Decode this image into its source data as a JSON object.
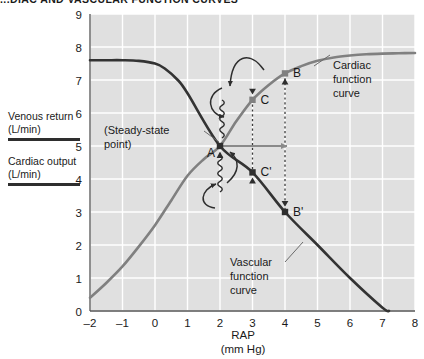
{
  "figure": {
    "title": "...DIAC AND VASCULAR FUNCTION CURVES",
    "background": "#ffffff",
    "plot_background": "#e0e0e0",
    "grid_color": "#ffffff"
  },
  "legend": {
    "entries": [
      {
        "label_line1": "Venous return",
        "label_line2": "(L/min)",
        "color": "#2e2e2e"
      },
      {
        "label_line1": "Cardiac output",
        "label_line2": "(L/min)",
        "color": "#2e2e2e"
      }
    ]
  },
  "annotations": {
    "cardiac_curve_label": {
      "line1": "Cardiac",
      "line2": "function",
      "line3": "curve"
    },
    "vascular_curve_label": {
      "line1": "Vascular",
      "line2": "function",
      "line3": "curve"
    },
    "steady_state_label": {
      "line1": "(Steady-state",
      "line2": "point)"
    },
    "points": [
      {
        "name": "A",
        "label": "A",
        "rap": 2,
        "flow": 5.0,
        "color": "#2e2e2e"
      },
      {
        "name": "B",
        "label": "B",
        "rap": 4,
        "flow": 7.2,
        "color": "#808080"
      },
      {
        "name": "C",
        "label": "C",
        "rap": 3,
        "flow": 6.4,
        "color": "#808080"
      },
      {
        "name": "Bp",
        "label": "B'",
        "rap": 4,
        "flow": 3.0,
        "color": "#2e2e2e"
      },
      {
        "name": "Cp",
        "label": "C'",
        "rap": 3,
        "flow": 4.2,
        "color": "#2e2e2e"
      }
    ]
  },
  "chart_data": {
    "type": "line",
    "xlabel": "RAP",
    "xlabel_units": "(mm Hg)",
    "ylabel": "Venous return / Cardiac output (L/min)",
    "xlim": [
      -2,
      8
    ],
    "ylim": [
      0,
      9
    ],
    "xticks": [
      "–2",
      "–1",
      "0",
      "1",
      "2",
      "3",
      "4",
      "5",
      "6",
      "7",
      "8"
    ],
    "yticks": [
      "0",
      "1",
      "2",
      "3",
      "4",
      "5",
      "6",
      "7",
      "8",
      "9"
    ],
    "grid": true,
    "legend_position": "left-outside",
    "series": [
      {
        "name": "Cardiac function curve",
        "color": "#808080",
        "width": 2.6,
        "x": [
          -2,
          -1.5,
          -1,
          -0.5,
          0,
          0.5,
          1,
          1.5,
          2,
          2.5,
          3,
          3.5,
          4,
          4.5,
          5,
          5.5,
          6,
          6.5,
          7,
          7.5,
          8
        ],
        "y": [
          0.4,
          0.85,
          1.35,
          1.95,
          2.6,
          3.35,
          4.1,
          4.6,
          5.0,
          5.75,
          6.4,
          6.85,
          7.2,
          7.42,
          7.58,
          7.68,
          7.74,
          7.78,
          7.8,
          7.81,
          7.82
        ]
      },
      {
        "name": "Vascular function curve",
        "color": "#333333",
        "width": 2.6,
        "x": [
          -2,
          -1.5,
          -1,
          -0.5,
          0,
          0.3,
          0.7,
          1,
          2,
          3,
          4,
          5,
          6,
          7,
          7.2
        ],
        "y": [
          7.6,
          7.6,
          7.6,
          7.58,
          7.5,
          7.35,
          7.0,
          6.6,
          5.0,
          4.2,
          3.0,
          2.0,
          1.0,
          0.1,
          0.0
        ]
      }
    ],
    "annotated_points": [
      {
        "label": "A",
        "x": 2,
        "y": 5.0
      },
      {
        "label": "C",
        "x": 3,
        "y": 6.4
      },
      {
        "label": "B",
        "x": 4,
        "y": 7.2
      },
      {
        "label": "C'",
        "x": 3,
        "y": 4.2
      },
      {
        "label": "B'",
        "x": 4,
        "y": 3.0
      }
    ]
  }
}
